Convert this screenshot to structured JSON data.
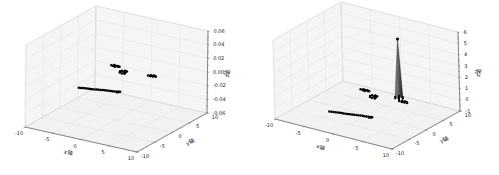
{
  "figure": {
    "background": "#ffffff",
    "colors": {
      "marker": "#000000",
      "grid": "#e0e0e0",
      "pane_side": "#f5f5f5",
      "pane_bottom": "#f2f2f2",
      "spine": "#707070",
      "tick_text": "#1a1a1a"
    }
  },
  "chart_data": [
    {
      "type": "scatter",
      "projection": "3d",
      "position": "left",
      "xlabel": "x轴",
      "ylabel": "y轴",
      "zlabel": "z轴",
      "xlim": [
        -10,
        10
      ],
      "ylim": [
        -10,
        10
      ],
      "zlim": [
        -0.06,
        0.06
      ],
      "xticks": [
        -10,
        -5,
        0,
        5,
        10
      ],
      "yticks": [
        -10,
        -5,
        0,
        5,
        10
      ],
      "zticks": [
        -0.06,
        -0.04,
        -0.02,
        0,
        0.02,
        0.04,
        0.06
      ],
      "xtick_labels": [
        "-10",
        "-5",
        "0",
        "5",
        "10"
      ],
      "ytick_labels": [
        "-10",
        "-5",
        "0",
        "5",
        "10"
      ],
      "ztick_labels": [
        "-0.06",
        "-0.04",
        "-0.02",
        "0.00",
        "0.02",
        "0.04",
        "0.06"
      ],
      "grid": true,
      "legend": null,
      "marker_color": "#000000",
      "clusters": [
        {
          "name": "diagonal-line",
          "points": [
            [
              -2.8,
              -6.3,
              0
            ],
            [
              -2.5,
              -6.2,
              0
            ],
            [
              -2.2,
              -6.1,
              0
            ],
            [
              -1.9,
              -6.0,
              0
            ],
            [
              -1.6,
              -5.9,
              0
            ],
            [
              -1.3,
              -5.8,
              0
            ],
            [
              -1.0,
              -5.7,
              0
            ],
            [
              -0.7,
              -5.7,
              0
            ],
            [
              -0.4,
              -5.6,
              0
            ],
            [
              -0.1,
              -5.5,
              0
            ],
            [
              0.2,
              -5.4,
              0
            ],
            [
              0.5,
              -5.3,
              0
            ],
            [
              0.8,
              -5.2,
              0
            ],
            [
              1.1,
              -5.1,
              0
            ],
            [
              1.4,
              -5.0,
              0
            ],
            [
              1.7,
              -4.9,
              0
            ],
            [
              2.0,
              -4.8,
              0
            ],
            [
              2.3,
              -4.8,
              0
            ],
            [
              2.6,
              -4.7,
              0
            ],
            [
              2.9,
              -4.6,
              0
            ],
            [
              3.1,
              -4.8,
              0
            ],
            [
              3.2,
              -4.5,
              0
            ],
            [
              3.3,
              -4.6,
              0
            ],
            [
              3.4,
              -4.4,
              0
            ]
          ]
        },
        {
          "name": "blob-left",
          "points": [
            [
              -3.8,
              4.6,
              0
            ],
            [
              -3.5,
              4.9,
              0
            ],
            [
              -3.4,
              4.5,
              0
            ],
            [
              -3.1,
              4.8,
              0
            ],
            [
              -3.0,
              4.4,
              0
            ],
            [
              -2.8,
              4.9,
              0
            ],
            [
              -2.6,
              4.6,
              0
            ],
            [
              -2.4,
              4.7,
              0
            ],
            [
              -3.2,
              4.6,
              0
            ]
          ]
        },
        {
          "name": "blob-center",
          "points": [
            [
              -1.2,
              3.5,
              0
            ],
            [
              -0.8,
              3.7,
              0
            ],
            [
              -0.4,
              3.6,
              0
            ],
            [
              -1.3,
              3.1,
              0
            ],
            [
              -1.1,
              2.7,
              0
            ],
            [
              -0.6,
              2.5,
              0
            ],
            [
              -0.2,
              2.6,
              0
            ],
            [
              -0.3,
              3.0,
              0
            ],
            [
              -0.7,
              3.2,
              0
            ]
          ]
        },
        {
          "name": "blob-right",
          "points": [
            [
              3.2,
              3.9,
              0
            ],
            [
              3.5,
              4.2,
              0
            ],
            [
              3.7,
              3.8,
              0
            ],
            [
              3.9,
              4.1,
              0
            ],
            [
              4.1,
              3.9,
              0
            ],
            [
              4.3,
              4.2,
              0
            ],
            [
              4.5,
              4.0,
              0
            ],
            [
              3.6,
              4.0,
              0
            ],
            [
              4.0,
              4.3,
              0
            ]
          ]
        }
      ]
    },
    {
      "type": "scatter",
      "projection": "3d",
      "position": "right",
      "xlabel": "x轴",
      "ylabel": "y轴",
      "zlabel": "z轴",
      "xlim": [
        -10,
        10
      ],
      "ylim": [
        -10,
        10
      ],
      "zlim": [
        -1,
        6
      ],
      "xticks": [
        -10,
        -5,
        0,
        5,
        10
      ],
      "yticks": [
        -10,
        -5,
        0,
        5,
        10
      ],
      "zticks": [
        -1,
        0,
        1,
        2,
        3,
        4,
        5,
        6
      ],
      "xtick_labels": [
        "-10",
        "-5",
        "0",
        "5",
        "10"
      ],
      "ytick_labels": [
        "-10",
        "-5",
        "0",
        "5",
        "10"
      ],
      "ztick_labels": [
        "-1",
        "0",
        "1",
        "2",
        "3",
        "4",
        "5",
        "6"
      ],
      "grid": true,
      "legend": null,
      "marker_color": "#000000",
      "clusters": [
        {
          "name": "diagonal-line",
          "points": [
            [
              -2.8,
              -6.3,
              0
            ],
            [
              -2.5,
              -6.2,
              0
            ],
            [
              -2.2,
              -6.1,
              0
            ],
            [
              -1.9,
              -6.0,
              0
            ],
            [
              -1.6,
              -5.9,
              0
            ],
            [
              -1.3,
              -5.8,
              0
            ],
            [
              -1.0,
              -5.7,
              0
            ],
            [
              -0.7,
              -5.7,
              0
            ],
            [
              -0.4,
              -5.6,
              0
            ],
            [
              -0.1,
              -5.5,
              0
            ],
            [
              0.2,
              -5.4,
              0
            ],
            [
              0.5,
              -5.3,
              0
            ],
            [
              0.8,
              -5.2,
              0
            ],
            [
              1.1,
              -5.1,
              0
            ],
            [
              1.4,
              -5.0,
              0
            ],
            [
              1.7,
              -4.9,
              0
            ],
            [
              2.0,
              -4.8,
              0
            ],
            [
              2.3,
              -4.8,
              0
            ],
            [
              2.6,
              -4.7,
              0
            ],
            [
              2.9,
              -4.6,
              0
            ],
            [
              3.1,
              -4.8,
              0
            ],
            [
              3.2,
              -4.5,
              0
            ],
            [
              3.3,
              -4.6,
              0
            ],
            [
              3.4,
              -4.4,
              0
            ]
          ]
        },
        {
          "name": "blob-left",
          "points": [
            [
              -3.8,
              4.6,
              0
            ],
            [
              -3.5,
              4.9,
              0
            ],
            [
              -3.4,
              4.5,
              0
            ],
            [
              -3.1,
              4.8,
              0
            ],
            [
              -3.0,
              4.4,
              0
            ],
            [
              -2.8,
              4.9,
              0
            ],
            [
              -2.6,
              4.6,
              0
            ],
            [
              -2.4,
              4.7,
              0
            ],
            [
              -3.2,
              4.6,
              0
            ]
          ]
        },
        {
          "name": "blob-center",
          "points": [
            [
              -1.2,
              3.5,
              0
            ],
            [
              -0.8,
              3.7,
              0
            ],
            [
              -0.4,
              3.6,
              0
            ],
            [
              -1.3,
              3.1,
              0
            ],
            [
              -1.1,
              2.7,
              0
            ],
            [
              -0.6,
              2.5,
              0
            ],
            [
              -0.2,
              2.6,
              0
            ],
            [
              -0.3,
              3.0,
              0
            ],
            [
              -0.7,
              3.2,
              0
            ]
          ]
        },
        {
          "name": "blob-right",
          "points": [
            [
              3.2,
              3.9,
              0
            ],
            [
              3.5,
              4.2,
              0
            ],
            [
              3.7,
              3.8,
              0
            ],
            [
              3.9,
              4.1,
              0
            ],
            [
              4.1,
              3.9,
              0
            ],
            [
              4.3,
              4.2,
              0
            ],
            [
              4.5,
              4.0,
              0
            ],
            [
              3.6,
              4.0,
              0
            ],
            [
              4.0,
              4.3,
              0
            ]
          ]
        }
      ],
      "spike": {
        "x": 2.7,
        "y": 4.7,
        "base_z": 0.1,
        "apex_z": 5.3,
        "base_radius": 0.65,
        "color_light": "#8f8f8f",
        "color_dark": "#1e1e1e"
      }
    }
  ]
}
